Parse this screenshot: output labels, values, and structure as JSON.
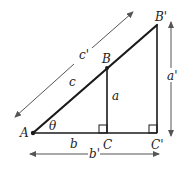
{
  "diagram": {
    "points": {
      "A": "A",
      "B": "B",
      "C": "C",
      "B_prime": "B'",
      "C_prime": "C'"
    },
    "sides": {
      "hyp_small": "c",
      "hyp_large": "c'",
      "opp_small": "a",
      "opp_large": "a'",
      "adj_small": "b",
      "adj_large": "b'"
    },
    "angle": "θ",
    "colors": {
      "line": "#1a1a1a",
      "dimension_arrow": "#555555",
      "background": "#ffffff"
    }
  }
}
